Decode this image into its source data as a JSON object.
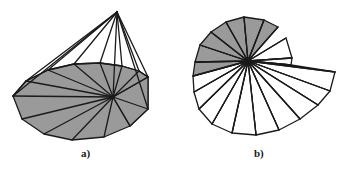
{
  "figure": {
    "panels": [
      {
        "id": "panel-a",
        "caption": "a)",
        "description": "three-dimensional triangulated cone surface with apex and fan-triangulated base"
      },
      {
        "id": "panel-b",
        "caption": "b)",
        "description": "planar spiral fan of triangles radiating from a common centre point"
      }
    ],
    "colors": {
      "fill_shaded": "#9a9a9a",
      "fill_unshaded": "#ffffff",
      "stroke": "#1a1a1a",
      "background": "#ffffff"
    },
    "panel_a": {
      "apex": [
        117,
        12
      ],
      "hub": [
        113,
        97
      ],
      "stroke_width": 1.3,
      "rim_front": [
        [
          13,
          96
        ],
        [
          26,
          81
        ],
        [
          48,
          70
        ],
        [
          74,
          64
        ],
        [
          100,
          63
        ],
        [
          122,
          66
        ],
        [
          139,
          71
        ],
        [
          148,
          77
        ]
      ],
      "base_outline": [
        [
          13,
          96
        ],
        [
          22,
          119
        ],
        [
          44,
          134
        ],
        [
          72,
          140
        ],
        [
          104,
          137
        ],
        [
          130,
          126
        ],
        [
          148,
          109
        ],
        [
          148,
          77
        ],
        [
          139,
          71
        ],
        [
          122,
          66
        ],
        [
          100,
          63
        ],
        [
          74,
          64
        ],
        [
          48,
          70
        ],
        [
          26,
          81
        ]
      ],
      "side_quad": [
        [
          113,
          97
        ],
        [
          148,
          77
        ],
        [
          148,
          109
        ],
        [
          130,
          126
        ]
      ],
      "cone_edges": [
        [
          [
            117,
            12
          ],
          [
            13,
            96
          ]
        ],
        [
          [
            117,
            12
          ],
          [
            26,
            81
          ]
        ],
        [
          [
            117,
            12
          ],
          [
            48,
            70
          ]
        ],
        [
          [
            117,
            12
          ],
          [
            74,
            64
          ]
        ],
        [
          [
            117,
            12
          ],
          [
            100,
            63
          ]
        ],
        [
          [
            117,
            12
          ],
          [
            113,
            97
          ]
        ],
        [
          [
            117,
            12
          ],
          [
            122,
            66
          ]
        ],
        [
          [
            117,
            12
          ],
          [
            139,
            71
          ]
        ],
        [
          [
            117,
            12
          ],
          [
            148,
            77
          ]
        ],
        [
          [
            117,
            12
          ],
          [
            148,
            109
          ]
        ]
      ],
      "base_fan_edges": [
        [
          [
            113,
            97
          ],
          [
            13,
            96
          ]
        ],
        [
          [
            113,
            97
          ],
          [
            22,
            119
          ]
        ],
        [
          [
            113,
            97
          ],
          [
            44,
            134
          ]
        ],
        [
          [
            113,
            97
          ],
          [
            72,
            140
          ]
        ],
        [
          [
            113,
            97
          ],
          [
            104,
            137
          ]
        ],
        [
          [
            113,
            97
          ],
          [
            130,
            126
          ]
        ],
        [
          [
            113,
            97
          ],
          [
            26,
            81
          ]
        ],
        [
          [
            113,
            97
          ],
          [
            48,
            70
          ]
        ],
        [
          [
            113,
            97
          ],
          [
            74,
            64
          ]
        ],
        [
          [
            113,
            97
          ],
          [
            100,
            63
          ]
        ],
        [
          [
            113,
            97
          ],
          [
            122,
            66
          ]
        ],
        [
          [
            113,
            97
          ],
          [
            139,
            71
          ]
        ],
        [
          [
            113,
            97
          ],
          [
            148,
            77
          ]
        ],
        [
          [
            113,
            97
          ],
          [
            148,
            109
          ]
        ]
      ]
    },
    "panel_b": {
      "centre": [
        248,
        61
      ],
      "stroke_width": 1.3,
      "triangle_count": 18,
      "shaded_count": 9,
      "vertices": [
        [
          286,
          38
        ],
        [
          292,
          58
        ],
        [
          291,
          65
        ],
        [
          335,
          72
        ],
        [
          330,
          91
        ],
        [
          318,
          105
        ],
        [
          300,
          119
        ],
        [
          279,
          130
        ],
        [
          256,
          135
        ],
        [
          232,
          133
        ],
        [
          212,
          124
        ],
        [
          199,
          109
        ],
        [
          194,
          92
        ],
        [
          193,
          76
        ],
        [
          195,
          62
        ],
        [
          200,
          45
        ],
        [
          211,
          32
        ],
        [
          226,
          22
        ],
        [
          244,
          17
        ],
        [
          264,
          20
        ],
        [
          278,
          27
        ]
      ],
      "shaded_indices": [
        13,
        14,
        15,
        16,
        17,
        18,
        19,
        20,
        0
      ]
    }
  }
}
